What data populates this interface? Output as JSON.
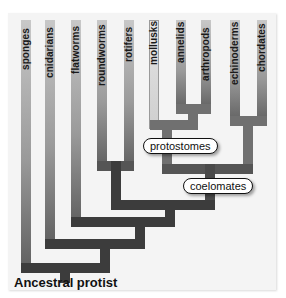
{
  "diagram": {
    "type": "phylogenetic-tree",
    "root": "Ancestral protist",
    "taxa": [
      {
        "name": "sponges"
      },
      {
        "name": "cnidarians"
      },
      {
        "name": "flatworms"
      },
      {
        "name": "roundworms"
      },
      {
        "name": "rotifers"
      },
      {
        "name": "mollusks"
      },
      {
        "name": "annelids"
      },
      {
        "name": "arthropods"
      },
      {
        "name": "echinoderms"
      },
      {
        "name": "chordates"
      }
    ],
    "clade_labels": {
      "protostomes": "protostomes",
      "coelomates": "coelomates"
    },
    "colors": {
      "branch_dark": "#3c3c3c",
      "branch_mid": "#707070",
      "branch_top": "#c8c8c8",
      "panel_bg": "#f4f4f4"
    }
  }
}
